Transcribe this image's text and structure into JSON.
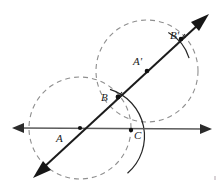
{
  "figure": {
    "width": 224,
    "height": 190,
    "background_color": "#ffffff"
  },
  "colors": {
    "ray_line": "#5a5a5a",
    "diagonal_line": "#1b1b1b",
    "dashed_circle": "#8f8f8f",
    "solid_arc": "#262626",
    "point_dot": "#111111",
    "label_text": "#1a1a1a"
  },
  "labels": [
    {
      "id": "A",
      "text": "A",
      "x": 56,
      "y": 140
    },
    {
      "id": "B",
      "text": "B",
      "x": 101,
      "y": 101
    },
    {
      "id": "C",
      "text": "C",
      "x": 134,
      "y": 139
    },
    {
      "id": "Ap",
      "text": "A'",
      "x": 133,
      "y": 66
    },
    {
      "id": "Bp",
      "text": "B'",
      "x": 170,
      "y": 40
    }
  ],
  "points": [
    {
      "id": "A",
      "label": "A",
      "x": 80,
      "y": 128,
      "dot": true
    },
    {
      "id": "B",
      "label": "B",
      "x": 118,
      "y": 97,
      "dot": true
    },
    {
      "id": "C",
      "label": "C",
      "x": 131,
      "y": 130,
      "dot": true
    },
    {
      "id": "Ap",
      "label": "A'",
      "x": 147,
      "y": 71,
      "dot": true
    },
    {
      "id": "Bp",
      "label": "B'",
      "x": 181,
      "y": 39,
      "dot": true
    }
  ],
  "lines": [
    {
      "id": "horizontal-ray",
      "kind": "double-arrow",
      "x1": 12,
      "y1": 128,
      "x2": 212,
      "y2": 129,
      "stroke": "#5a5a5a",
      "stroke_width": 1.4
    },
    {
      "id": "diagonal-ray",
      "kind": "double-arrow",
      "x1": 33,
      "y1": 178,
      "x2": 209,
      "y2": 14,
      "stroke": "#1b1b1b",
      "stroke_width": 2.0
    }
  ],
  "dashed_circles": [
    {
      "id": "circle-A",
      "center_label": "A",
      "cx": 80,
      "cy": 128,
      "r": 51,
      "stroke": "#8f8f8f"
    },
    {
      "id": "circle-Ap",
      "center_label": "A'",
      "cx": 147,
      "cy": 71,
      "r": 51,
      "stroke": "#8f8f8f"
    }
  ],
  "solid_arcs": [
    {
      "id": "arc-A-through-B-C",
      "center_label": "A",
      "cx": 80,
      "cy": 128,
      "r": 49,
      "start_angle_deg": -52,
      "end_angle_deg": 14,
      "stroke": "#262626",
      "note": "compass arc centered at A passing through B and C"
    },
    {
      "id": "arc-Ap-through-Bp",
      "center_label": "A'",
      "cx": 147,
      "cy": 71,
      "r": 44,
      "start_angle_deg": -61,
      "end_angle_deg": -17,
      "stroke": "#262626",
      "note": "compass arc centered at A' passing through B'"
    }
  ],
  "tick_marks": [
    {
      "id": "tick-B",
      "x": 113,
      "y": 104,
      "angle_deg": 42,
      "length": 9
    },
    {
      "id": "tick-Bp",
      "x": 176,
      "y": 46,
      "angle_deg": 42,
      "length": 9
    }
  ]
}
